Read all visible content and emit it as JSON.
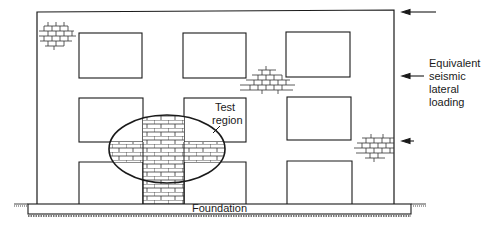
{
  "diagram": {
    "labels": {
      "test_region_line1": "Test",
      "test_region_line2": "region",
      "loading_line1": "Equivalent",
      "loading_line2": "seismic",
      "loading_line3": "lateral",
      "loading_line4": "loading",
      "foundation": "Foundation"
    },
    "elements": {
      "building_frame": "masonry-infilled building elevation, 3 storeys x 3 bays",
      "windows_count": 9,
      "lateral_load_arrows": 3,
      "brick_patches": [
        "top-left corner",
        "upper middle",
        "right wall lower",
        "test region cross"
      ]
    },
    "colors": {
      "line": "#1a1a1a",
      "background": "#ffffff"
    }
  }
}
